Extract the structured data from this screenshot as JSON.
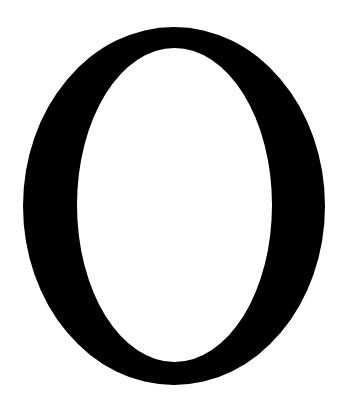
{
  "glyph": {
    "character": "O",
    "color": "#000000",
    "background": "#ffffff",
    "outer": {
      "cx": 174,
      "cy": 206,
      "rx": 151,
      "ry": 179
    },
    "inner": {
      "cx": 174.5,
      "cy": 205,
      "rx": 97.5,
      "ry": 157
    }
  }
}
